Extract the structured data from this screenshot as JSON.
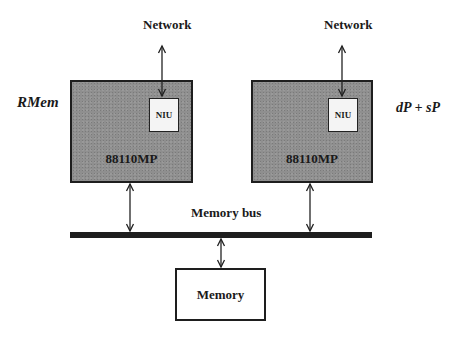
{
  "diagram": {
    "nodes": {
      "left_processor": {
        "label": "88110MP",
        "niu_label": "NIU",
        "side_label": "RMem",
        "network_label": "Network"
      },
      "right_processor": {
        "label": "88110MP",
        "niu_label": "NIU",
        "side_label": "dP + sP",
        "network_label": "Network"
      },
      "bus": {
        "label": "Memory bus"
      },
      "memory": {
        "label": "Memory"
      }
    },
    "edges": [
      {
        "from": "left_processor.niu",
        "to": "network",
        "type": "bidirectional"
      },
      {
        "from": "right_processor.niu",
        "to": "network",
        "type": "bidirectional"
      },
      {
        "from": "left_processor",
        "to": "bus",
        "type": "bidirectional"
      },
      {
        "from": "right_processor",
        "to": "bus",
        "type": "bidirectional"
      },
      {
        "from": "bus",
        "to": "memory",
        "type": "bidirectional"
      }
    ],
    "colors": {
      "processor_fill": "#8f8f8f",
      "outline": "#1e1e1e",
      "niu_fill": "#f4f4f4"
    }
  }
}
